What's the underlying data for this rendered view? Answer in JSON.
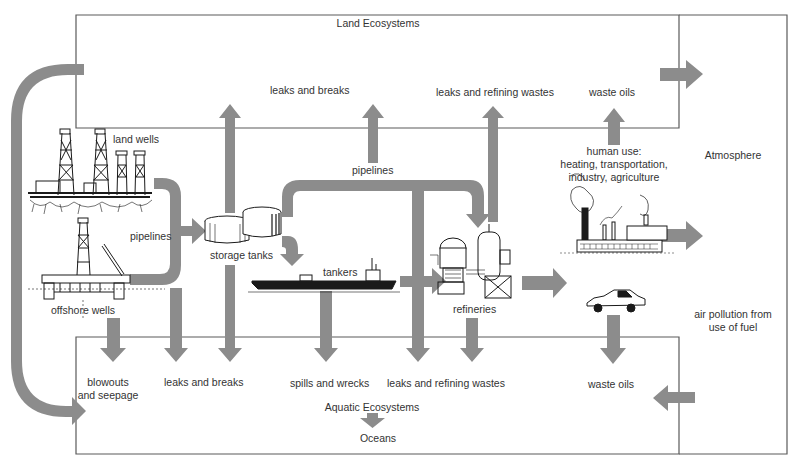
{
  "diagram": {
    "colors": {
      "arrow": "#8c8c8c",
      "box_border": "#555555",
      "illustration": "#1a1a1a",
      "background": "#ffffff"
    },
    "regions": {
      "land": "Land Ecosystems",
      "atmosphere": "Atmosphere",
      "aquatic": "Aquatic Ecosystems",
      "oceans": "Oceans"
    },
    "sources": {
      "land_wells": "land wells",
      "offshore_wells": "offshore wells",
      "pipelines_left": "pipelines",
      "storage_tanks": "storage tanks",
      "pipelines_top": "pipelines",
      "tankers": "tankers",
      "refineries": "refineries",
      "human_use": "human use:\nheating, transportation,\nindustry, agriculture"
    },
    "land_outputs": {
      "leaks_breaks": "leaks and breaks",
      "leaks_refining": "leaks and refining wastes",
      "waste_oils": "waste oils"
    },
    "aquatic_outputs": {
      "blowouts_line1": "blowouts",
      "blowouts_line2": "and seepage",
      "leaks_breaks": "leaks and breaks",
      "spills_wrecks": "spills and wrecks",
      "leaks_refining": "leaks and refining wastes",
      "waste_oils": "waste oils"
    },
    "atmosphere_outputs": {
      "air_pollution_line1": "air pollution from",
      "air_pollution_line2": "use of fuel"
    },
    "human_use_lines": [
      "human use:",
      "heating, transportation,",
      "industry, agriculture"
    ]
  }
}
